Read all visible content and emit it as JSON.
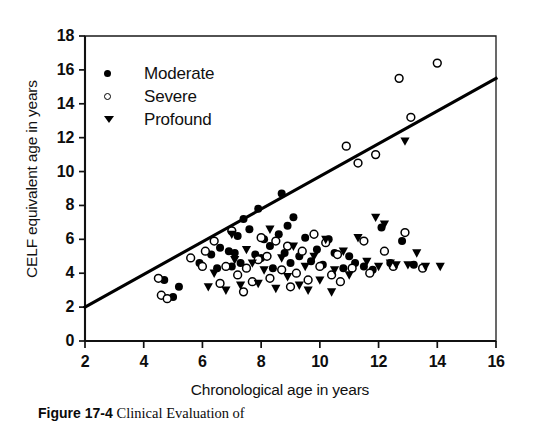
{
  "figure": {
    "caption_label": "Figure 17-4",
    "caption_text": "Clinical Evaluation of"
  },
  "chart_data": {
    "type": "scatter",
    "title": "",
    "xlabel": "Chronological age in years",
    "ylabel": "CELF equivalent age in years",
    "xlim": [
      2,
      16
    ],
    "ylim": [
      0,
      18
    ],
    "xticks": [
      2,
      4,
      6,
      8,
      10,
      12,
      14,
      16
    ],
    "yticks": [
      0,
      2,
      4,
      6,
      8,
      10,
      12,
      14,
      16,
      18
    ],
    "grid": false,
    "legend_position": "top-left",
    "reference_line": {
      "name": "identity-trend-line",
      "x0": 2,
      "y0": 2,
      "x1": 16,
      "y1": 15.5,
      "color": "#000000"
    },
    "series": [
      {
        "name": "Moderate",
        "marker": "filled-circle",
        "color": "#000000",
        "points": [
          [
            4.7,
            3.6
          ],
          [
            5.0,
            2.6
          ],
          [
            5.2,
            3.2
          ],
          [
            5.9,
            4.6
          ],
          [
            6.3,
            5.1
          ],
          [
            6.5,
            4.3
          ],
          [
            6.6,
            5.5
          ],
          [
            6.9,
            5.3
          ],
          [
            7.0,
            4.4
          ],
          [
            7.1,
            5.2
          ],
          [
            7.2,
            6.2
          ],
          [
            7.3,
            4.6
          ],
          [
            7.4,
            7.2
          ],
          [
            7.6,
            6.6
          ],
          [
            7.8,
            5.1
          ],
          [
            7.9,
            7.8
          ],
          [
            8.0,
            4.9
          ],
          [
            8.1,
            6.0
          ],
          [
            8.3,
            5.6
          ],
          [
            8.4,
            4.3
          ],
          [
            8.6,
            6.3
          ],
          [
            8.7,
            8.7
          ],
          [
            8.8,
            5.2
          ],
          [
            8.9,
            6.8
          ],
          [
            9.0,
            4.6
          ],
          [
            9.1,
            7.3
          ],
          [
            9.3,
            5.0
          ],
          [
            9.5,
            6.1
          ],
          [
            9.7,
            4.7
          ],
          [
            9.9,
            5.4
          ],
          [
            10.1,
            4.5
          ],
          [
            10.3,
            6.0
          ],
          [
            10.5,
            5.2
          ],
          [
            10.8,
            4.3
          ],
          [
            11.0,
            5.0
          ],
          [
            11.2,
            4.6
          ],
          [
            11.5,
            4.4
          ],
          [
            11.8,
            4.2
          ],
          [
            12.1,
            6.7
          ],
          [
            12.4,
            4.6
          ],
          [
            12.8,
            5.9
          ],
          [
            13.2,
            4.5
          ]
        ]
      },
      {
        "name": "Severe",
        "marker": "open-circle",
        "color": "#000000",
        "points": [
          [
            4.5,
            3.7
          ],
          [
            4.6,
            2.7
          ],
          [
            4.8,
            2.5
          ],
          [
            5.6,
            4.9
          ],
          [
            6.0,
            4.4
          ],
          [
            6.1,
            5.3
          ],
          [
            6.4,
            5.9
          ],
          [
            6.8,
            4.4
          ],
          [
            7.0,
            6.5
          ],
          [
            7.2,
            3.9
          ],
          [
            7.5,
            4.3
          ],
          [
            7.7,
            3.5
          ],
          [
            7.9,
            4.8
          ],
          [
            8.0,
            6.1
          ],
          [
            8.2,
            5.0
          ],
          [
            8.3,
            3.7
          ],
          [
            8.5,
            5.9
          ],
          [
            8.7,
            4.2
          ],
          [
            8.9,
            5.6
          ],
          [
            9.2,
            4.0
          ],
          [
            9.4,
            5.3
          ],
          [
            9.6,
            3.6
          ],
          [
            9.8,
            6.3
          ],
          [
            10.0,
            4.4
          ],
          [
            10.2,
            5.8
          ],
          [
            10.4,
            3.9
          ],
          [
            10.6,
            5.1
          ],
          [
            10.9,
            11.5
          ],
          [
            11.1,
            4.3
          ],
          [
            11.3,
            10.5
          ],
          [
            11.5,
            5.9
          ],
          [
            11.7,
            4.0
          ],
          [
            11.9,
            11.0
          ],
          [
            12.2,
            5.3
          ],
          [
            12.5,
            4.4
          ],
          [
            12.7,
            15.5
          ],
          [
            12.9,
            6.4
          ],
          [
            13.1,
            13.2
          ],
          [
            13.5,
            4.3
          ],
          [
            14.0,
            16.4
          ],
          [
            6.6,
            3.4
          ],
          [
            7.4,
            2.9
          ],
          [
            9.0,
            3.2
          ],
          [
            10.7,
            3.5
          ]
        ]
      },
      {
        "name": "Profound",
        "marker": "filled-triangle-down",
        "color": "#000000",
        "points": [
          [
            6.2,
            3.2
          ],
          [
            6.4,
            4.0
          ],
          [
            6.8,
            3.0
          ],
          [
            7.1,
            4.8
          ],
          [
            7.3,
            3.3
          ],
          [
            7.5,
            5.4
          ],
          [
            7.7,
            4.6
          ],
          [
            7.9,
            3.4
          ],
          [
            8.1,
            4.2
          ],
          [
            8.3,
            6.6
          ],
          [
            8.5,
            3.1
          ],
          [
            8.7,
            4.9
          ],
          [
            8.9,
            3.8
          ],
          [
            9.1,
            5.6
          ],
          [
            9.3,
            3.3
          ],
          [
            9.5,
            4.4
          ],
          [
            9.8,
            5.0
          ],
          [
            10.0,
            3.6
          ],
          [
            10.2,
            6.0
          ],
          [
            10.5,
            4.2
          ],
          [
            10.8,
            5.3
          ],
          [
            11.0,
            3.9
          ],
          [
            11.3,
            6.1
          ],
          [
            11.6,
            4.7
          ],
          [
            11.9,
            7.3
          ],
          [
            12.0,
            4.4
          ],
          [
            12.2,
            6.9
          ],
          [
            12.4,
            4.6
          ],
          [
            12.6,
            4.5
          ],
          [
            12.9,
            11.8
          ],
          [
            13.0,
            4.5
          ],
          [
            13.3,
            5.2
          ],
          [
            13.6,
            4.4
          ],
          [
            14.1,
            4.4
          ],
          [
            7.0,
            6.3
          ],
          [
            9.6,
            3.0
          ],
          [
            10.4,
            2.9
          ]
        ]
      }
    ]
  },
  "axes": {
    "x_tick_labels": [
      "2",
      "4",
      "6",
      "8",
      "10",
      "12",
      "14",
      "16"
    ],
    "y_tick_labels": [
      "0",
      "2",
      "4",
      "6",
      "8",
      "10",
      "12",
      "14",
      "16",
      "18"
    ]
  },
  "legend": {
    "items": [
      {
        "label": "Moderate",
        "marker": "filled-circle"
      },
      {
        "label": "Severe",
        "marker": "open-circle"
      },
      {
        "label": "Profound",
        "marker": "filled-triangle-down"
      }
    ]
  }
}
